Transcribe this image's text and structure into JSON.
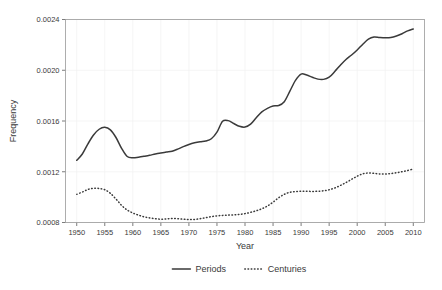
{
  "chart_data": {
    "type": "line",
    "title": "",
    "xlabel": "Year",
    "ylabel": "Frequency",
    "xlim": [
      1948,
      2012
    ],
    "ylim": [
      0.0008,
      0.0024
    ],
    "grid": true,
    "legend_position": "bottom",
    "x_ticks": [
      1950,
      1955,
      1960,
      1965,
      1970,
      1975,
      1980,
      1985,
      1990,
      1995,
      2000,
      2005,
      2010
    ],
    "x_tick_labels": [
      "1950",
      "1955",
      "1960",
      "1965",
      "1970",
      "1975",
      "1980",
      "1985",
      "1990",
      "1995",
      "2000",
      "2005",
      "2010"
    ],
    "y_ticks": [
      0.0008,
      0.0012,
      0.0016,
      0.002,
      0.0024
    ],
    "y_tick_labels": [
      "0.0008",
      "0.0012",
      "0.0016",
      "0.0020",
      "0.0024"
    ],
    "x": [
      1950,
      1951,
      1952,
      1953,
      1954,
      1955,
      1956,
      1957,
      1958,
      1959,
      1960,
      1961,
      1962,
      1963,
      1964,
      1965,
      1966,
      1967,
      1968,
      1969,
      1970,
      1971,
      1972,
      1973,
      1974,
      1975,
      1976,
      1977,
      1978,
      1979,
      1980,
      1981,
      1982,
      1983,
      1984,
      1985,
      1986,
      1987,
      1988,
      1989,
      1990,
      1991,
      1992,
      1993,
      1994,
      1995,
      1996,
      1997,
      1998,
      1999,
      2000,
      2001,
      2002,
      2003,
      2004,
      2005,
      2006,
      2007,
      2008,
      2009,
      2010
    ],
    "series": [
      {
        "name": "Periods",
        "style": "solid",
        "color": "#3a3a3a",
        "values": [
          0.00129,
          0.00134,
          0.00142,
          0.00149,
          0.001535,
          0.00155,
          0.00153,
          0.00147,
          0.001385,
          0.00132,
          0.00131,
          0.001315,
          0.001322,
          0.00133,
          0.00134,
          0.001348,
          0.001355,
          0.001362,
          0.001378,
          0.001398,
          0.001415,
          0.001428,
          0.001437,
          0.001443,
          0.00146,
          0.001512,
          0.001598,
          0.001603,
          0.00158,
          0.001558,
          0.001552,
          0.001575,
          0.001625,
          0.001672,
          0.0017,
          0.001718,
          0.001722,
          0.001752,
          0.001835,
          0.00192,
          0.00197,
          0.001962,
          0.001945,
          0.00193,
          0.001928,
          0.001945,
          0.00199,
          0.00204,
          0.002085,
          0.00212,
          0.00216,
          0.002205,
          0.002245,
          0.002262,
          0.002258,
          0.002256,
          0.002258,
          0.00227,
          0.002288,
          0.00231,
          0.002325
        ]
      },
      {
        "name": "Centuries",
        "style": "dotted",
        "color": "#3a3a3a",
        "values": [
          0.001022,
          0.00104,
          0.00106,
          0.00107,
          0.001068,
          0.001058,
          0.00103,
          0.000985,
          0.000935,
          0.000898,
          0.000875,
          0.000858,
          0.000845,
          0.000836,
          0.00083,
          0.000826,
          0.000828,
          0.000832,
          0.00083,
          0.000826,
          0.000823,
          0.000824,
          0.00083,
          0.000838,
          0.000846,
          0.000852,
          0.000856,
          0.000858,
          0.00086,
          0.000864,
          0.00087,
          0.00088,
          0.000892,
          0.000908,
          0.00093,
          0.00096,
          0.000995,
          0.001022,
          0.001038,
          0.001044,
          0.001046,
          0.001046,
          0.001045,
          0.001046,
          0.00105,
          0.001058,
          0.001072,
          0.001092,
          0.001115,
          0.00114,
          0.001165,
          0.001184,
          0.00119,
          0.001187,
          0.001183,
          0.001182,
          0.001186,
          0.001192,
          0.0012,
          0.00121,
          0.001222
        ]
      }
    ]
  },
  "legend": {
    "items": [
      {
        "label": "Periods",
        "style": "solid"
      },
      {
        "label": "Centuries",
        "style": "dotted"
      }
    ]
  }
}
